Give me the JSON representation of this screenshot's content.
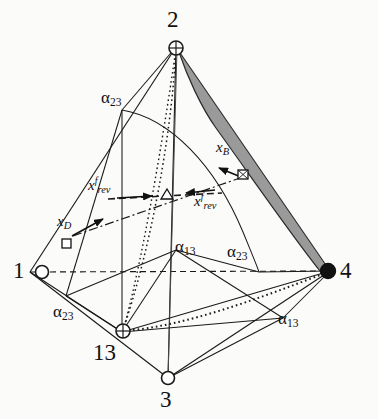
{
  "figure": {
    "type": "tetrahedron-composition-diagram",
    "background_color": "#fbfbfa",
    "stroke_color": "#1a1a1a",
    "shaded_region_color": "#9a9a9a"
  },
  "vertices": [
    {
      "id": "v1",
      "label": "1",
      "marker": "open-circle",
      "x": 30,
      "y": 272
    },
    {
      "id": "v2",
      "label": "2",
      "marker": "crossed-circle",
      "x": 176,
      "y": 47
    },
    {
      "id": "v3",
      "label": "3",
      "marker": "open-circle",
      "x": 168,
      "y": 378
    },
    {
      "id": "v4",
      "label": "4",
      "marker": "filled-circle",
      "x": 330,
      "y": 271
    },
    {
      "id": "v13",
      "label": "13",
      "marker": "crossed-circle",
      "x": 122,
      "y": 332
    }
  ],
  "alpha_labels": [
    {
      "id": "a23-top",
      "base": "α",
      "sub": "23"
    },
    {
      "id": "a23-left",
      "base": "α",
      "sub": "23"
    },
    {
      "id": "a13-mid",
      "base": "α",
      "sub": "13"
    },
    {
      "id": "a23-mid",
      "base": "α",
      "sub": "23"
    },
    {
      "id": "a13-bottom",
      "base": "α",
      "sub": "13"
    }
  ],
  "stream_labels": [
    {
      "id": "xD",
      "base": "x",
      "sub": "D",
      "sup": ""
    },
    {
      "id": "xB",
      "base": "x",
      "sub": "B",
      "sup": ""
    },
    {
      "id": "xrev-left",
      "base": "x",
      "sub": "rev",
      "sup": "f"
    },
    {
      "id": "xrev-right",
      "base": "x",
      "sub": "rev",
      "sup": "f"
    }
  ],
  "markers": {
    "distillate_square": "open-square",
    "bottoms_square": "crossed-square",
    "feed_triangle": "open-triangle"
  },
  "line_styles": {
    "edge": "solid",
    "hidden_edge": "dashed",
    "axis_dotted": "dotted",
    "material_balance": "dash-dot",
    "feed_path": "dashed"
  }
}
